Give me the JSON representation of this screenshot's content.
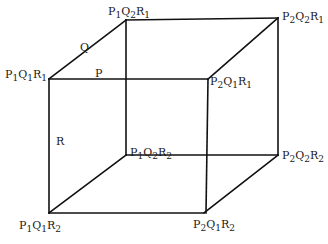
{
  "diagram": {
    "type": "cube",
    "vertices": [
      {
        "id": "P1Q1R1",
        "factors": [
          "P",
          "1",
          "Q",
          "1",
          "R",
          "1"
        ],
        "x": 49,
        "y": 79
      },
      {
        "id": "P2Q1R1",
        "factors": [
          "P",
          "2",
          "Q",
          "1",
          "R",
          "1"
        ],
        "x": 208,
        "y": 79
      },
      {
        "id": "P1Q2R1",
        "factors": [
          "P",
          "1",
          "Q",
          "2",
          "R",
          "1"
        ],
        "x": 126,
        "y": 20
      },
      {
        "id": "P2Q2R1",
        "factors": [
          "P",
          "2",
          "Q",
          "2",
          "R",
          "1"
        ],
        "x": 278,
        "y": 18
      },
      {
        "id": "P1Q1R2",
        "factors": [
          "P",
          "1",
          "Q",
          "1",
          "R",
          "2"
        ],
        "x": 49,
        "y": 213
      },
      {
        "id": "P2Q1R2",
        "factors": [
          "P",
          "2",
          "Q",
          "1",
          "R",
          "2"
        ],
        "x": 204,
        "y": 213
      },
      {
        "id": "P1Q2R2",
        "factors": [
          "P",
          "1",
          "Q",
          "2",
          "R",
          "2"
        ],
        "x": 126,
        "y": 155
      },
      {
        "id": "P2Q2R2",
        "factors": [
          "P",
          "2",
          "Q",
          "2",
          "R",
          "2"
        ],
        "x": 278,
        "y": 155
      }
    ],
    "axis_labels": {
      "p": "P",
      "q": "Q",
      "r": "R"
    },
    "labels": {
      "p1q2r1": {
        "a": "P",
        "as": "1",
        "b": "Q",
        "bs": "2",
        "c": "R",
        "cs": "1"
      },
      "p2q2r1": {
        "a": "P",
        "as": "2",
        "b": "Q",
        "bs": "2",
        "c": "R",
        "cs": "1"
      },
      "p1q1r1": {
        "a": "P",
        "as": "1",
        "b": "Q",
        "bs": "1",
        "c": "R",
        "cs": "1"
      },
      "p2q1r1": {
        "a": "P",
        "as": "2",
        "b": "Q",
        "bs": "1",
        "c": "R",
        "cs": "1"
      },
      "p1q2r2": {
        "a": "P",
        "as": "1",
        "b": "Q",
        "bs": "2",
        "c": "R",
        "cs": "2"
      },
      "p2q2r2": {
        "a": "P",
        "as": "2",
        "b": "Q",
        "bs": "2",
        "c": "R",
        "cs": "2"
      },
      "p1q1r2": {
        "a": "P",
        "as": "1",
        "b": "Q",
        "bs": "1",
        "c": "R",
        "cs": "2"
      },
      "p2q1r2": {
        "a": "P",
        "as": "2",
        "b": "Q",
        "bs": "1",
        "c": "R",
        "cs": "2"
      }
    },
    "colors": {
      "line": "#111111",
      "text": "#1a1a1a",
      "background": "#ffffff"
    }
  }
}
